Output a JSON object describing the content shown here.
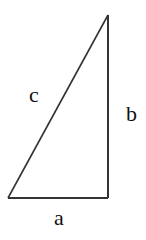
{
  "diagram": {
    "stroke_color": "#333333",
    "label_color": "#111111",
    "vertices": {
      "bottom_left": [
        8,
        198
      ],
      "bottom_right": [
        108,
        198
      ],
      "top": [
        108,
        15
      ]
    },
    "labels": {
      "hypotenuse": "c",
      "vertical_leg": "b",
      "horizontal_leg": "a"
    }
  }
}
